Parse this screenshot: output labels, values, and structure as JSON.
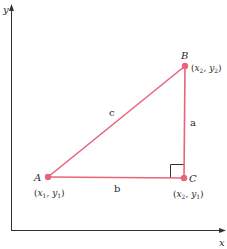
{
  "diagram": {
    "type": "right-triangle-on-coordinate-axes",
    "axes": {
      "x_label": "x",
      "y_label": "y",
      "color": "#333333"
    },
    "triangle": {
      "color": "#e8647c",
      "vertices": [
        {
          "name": "A",
          "coord_label_x": "x",
          "coord_label_x_sub": "1",
          "coord_label_y": "y",
          "coord_label_y_sub": "1"
        },
        {
          "name": "B",
          "coord_label_x": "x",
          "coord_label_x_sub": "2",
          "coord_label_y": "y",
          "coord_label_y_sub": "2"
        },
        {
          "name": "C",
          "coord_label_x": "x",
          "coord_label_x_sub": "2",
          "coord_label_y": "y",
          "coord_label_y_sub": "1"
        }
      ],
      "sides": {
        "a": "a",
        "b": "b",
        "c": "c"
      },
      "right_angle_at": "C"
    }
  }
}
